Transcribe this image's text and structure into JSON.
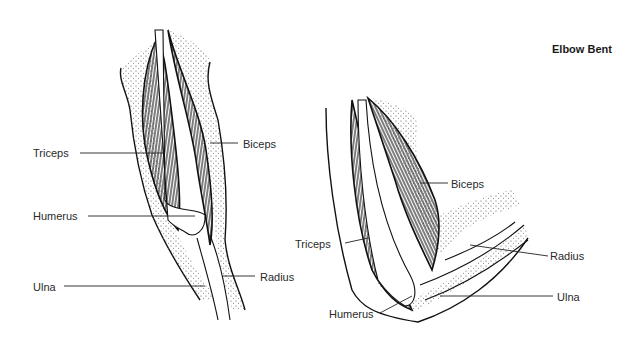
{
  "title": "Elbow Bent",
  "straight_arm": {
    "labels": {
      "triceps": "Triceps",
      "biceps": "Biceps",
      "humerus": "Humerus",
      "radius": "Radius",
      "ulna": "Ulna"
    }
  },
  "bent_arm": {
    "labels": {
      "biceps": "Biceps",
      "triceps": "Triceps",
      "radius": "Radius",
      "ulna": "Ulna",
      "humerus": "Humerus"
    }
  },
  "colors": {
    "ink": "#111111",
    "background": "#ffffff",
    "stipple": "#555555"
  }
}
